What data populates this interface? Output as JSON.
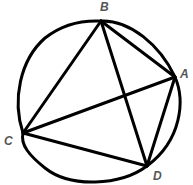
{
  "diagram": {
    "type": "cyclic-quadrilateral",
    "stroke_color": "#000000",
    "label_color": "#555555",
    "circle": {
      "cx": 100,
      "cy": 104,
      "r": 81
    },
    "vertices": [
      {
        "name": "A",
        "x": 175,
        "y": 77,
        "label": "A",
        "label_x": 180,
        "label_y": 78
      },
      {
        "name": "B",
        "x": 101,
        "y": 21,
        "label": "B",
        "label_x": 100,
        "label_y": 11
      },
      {
        "name": "C",
        "x": 23,
        "y": 133,
        "label": "C",
        "label_x": 4,
        "label_y": 145
      },
      {
        "name": "D",
        "x": 147,
        "y": 166,
        "label": "D",
        "label_x": 153,
        "label_y": 180
      }
    ],
    "segments": [
      {
        "from": "A",
        "to": "B",
        "kind": "side"
      },
      {
        "from": "B",
        "to": "C",
        "kind": "side"
      },
      {
        "from": "C",
        "to": "D",
        "kind": "side"
      },
      {
        "from": "D",
        "to": "A",
        "kind": "side"
      },
      {
        "from": "A",
        "to": "C",
        "kind": "diagonal"
      },
      {
        "from": "B",
        "to": "D",
        "kind": "diagonal"
      }
    ]
  }
}
